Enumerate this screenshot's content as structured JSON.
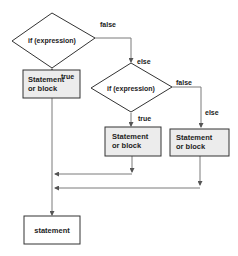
{
  "diagram": {
    "type": "flowchart",
    "title": "",
    "colors": {
      "line": "#7a7a7a",
      "border": "#333333",
      "box_fill": "#ececec",
      "final_fill": "#ffffff",
      "text": "#222222"
    },
    "nodes": {
      "cond1": {
        "label": "if (expression)"
      },
      "block1": {
        "line1": "Statement",
        "line2": "or block"
      },
      "cond2": {
        "label": "if (expression)"
      },
      "block2": {
        "line1": "Statement",
        "line2": "or block"
      },
      "block3": {
        "line1": "Statement",
        "line2": "or block"
      },
      "final": {
        "label": "statement"
      }
    },
    "edge_labels": {
      "cond1_false": "false",
      "cond1_true": "true",
      "cond2_else": "else",
      "cond2_false": "false",
      "cond2_true": "true",
      "block3_else": "else"
    }
  }
}
